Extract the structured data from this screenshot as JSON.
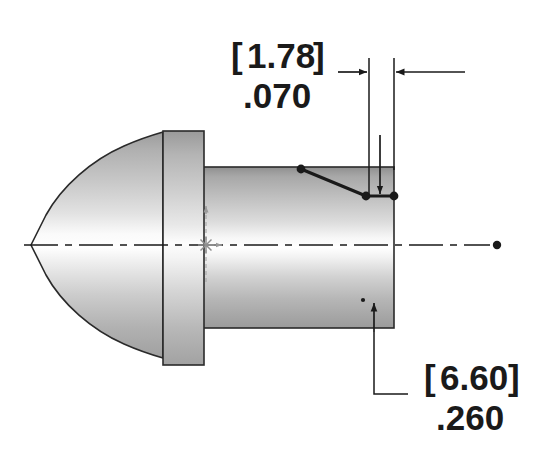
{
  "drawing": {
    "title": "Projectile Side View Engineering Drawing",
    "background_color": "#ffffff",
    "line_color": "#1a1a1a",
    "construction_color": "#8a8a8a",
    "body_fill_light": "#fdfdfd",
    "body_fill_dark": "#9a9a9a"
  },
  "dimensions": [
    {
      "id": "width-dimension",
      "metric_value": "1.78",
      "metric_bracketed": "[1.78]",
      "bracket_open": "[",
      "bracket_close": "]",
      "imperial_value": ".070",
      "units": "mm / in",
      "placement": "top"
    },
    {
      "id": "height-dimension",
      "metric_value": "6.60",
      "metric_bracketed": "[6.60]",
      "bracket_open": "[",
      "bracket_close": "]",
      "imperial_value": ".260",
      "units": "mm / in",
      "placement": "bottom-right"
    }
  ],
  "geometry": {
    "nose_tip_x": 31,
    "nose_tip_y": 245,
    "centerline_end_x": 498,
    "centerline_y": 245,
    "body_right_x": 394,
    "body_top_y": 167,
    "body_bottom_y": 328,
    "flange_left_x": 163,
    "flange_right_x": 204,
    "flange_top_y": 131,
    "flange_bottom_y": 365,
    "origin_x": 206,
    "origin_y": 245
  },
  "annotations": {
    "origin_marker": "sketch-origin-asterisk",
    "x_axis_arrow": "x-axis-arrow",
    "y_axis_arrow": "y-axis-arrow",
    "centerline_style": "dash-dot",
    "chamfer_line": "chamfer-sketch-segment",
    "endpoint_dots": 4
  }
}
